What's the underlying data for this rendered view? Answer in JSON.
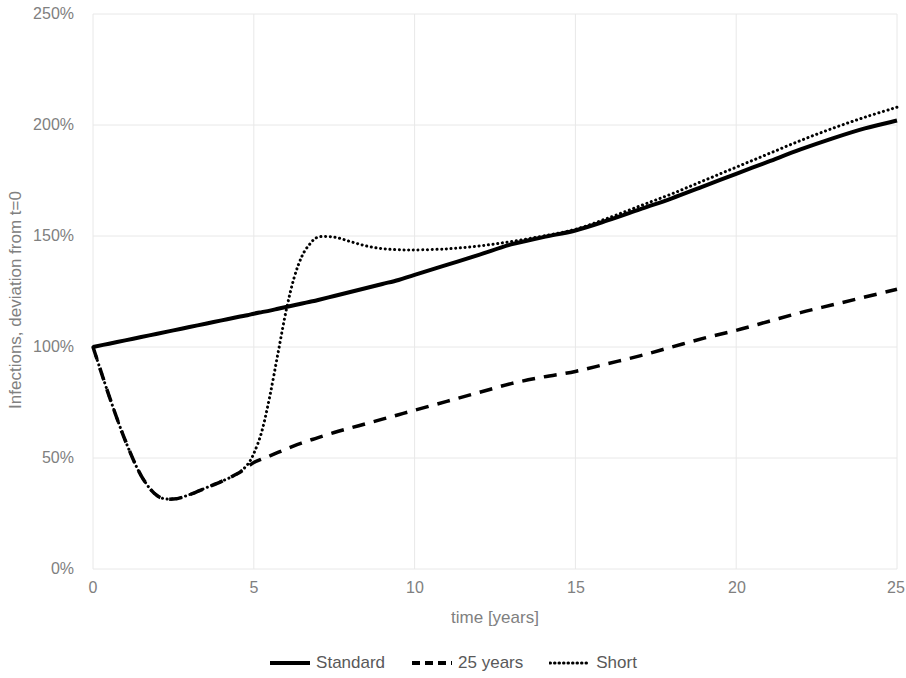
{
  "chart_data": {
    "type": "line",
    "title": "",
    "xlabel": "time [years]",
    "ylabel": "Infections, deviation from t=0",
    "xlim": [
      0,
      25
    ],
    "ylim": [
      0,
      250
    ],
    "xticks": [
      "0",
      "5",
      "10",
      "15",
      "20",
      "25"
    ],
    "yticks": [
      "0%",
      "50%",
      "100%",
      "150%",
      "200%",
      "250%"
    ],
    "grid": true,
    "legend_position": "bottom",
    "units": "percent",
    "x": [
      0,
      0.5,
      1,
      1.5,
      2,
      2.5,
      3,
      3.5,
      4,
      4.5,
      4.8,
      5,
      5.25,
      5.5,
      5.75,
      6,
      6.25,
      6.5,
      6.75,
      7,
      7.5,
      8,
      8.5,
      9,
      9.5,
      10,
      11,
      12,
      13,
      14,
      15,
      16,
      17,
      18,
      19,
      20,
      21,
      22,
      23,
      24,
      25
    ],
    "series": [
      {
        "name": "Standard",
        "style": "solid",
        "color": "#000000",
        "values": [
          100,
          101.5,
          103,
          104.5,
          106,
          107.5,
          109,
          110.5,
          112,
          113.5,
          114.3,
          115,
          115.7,
          116.4,
          117.2,
          118,
          118.8,
          119.6,
          120.4,
          121.2,
          123,
          124.8,
          126.6,
          128.4,
          130.2,
          132.5,
          137,
          141.5,
          146.2,
          149.5,
          152.5,
          157,
          162,
          167,
          172.5,
          178,
          183.5,
          189,
          194,
          198.5,
          202
        ]
      },
      {
        "name": "25 years",
        "style": "dashed",
        "color": "#000000",
        "values": [
          100,
          78,
          58,
          42,
          33,
          31.5,
          33.5,
          36.5,
          39.5,
          43,
          46,
          48,
          49.5,
          51,
          52.5,
          54,
          55.5,
          56.8,
          58,
          59.2,
          61.5,
          63.5,
          65.5,
          67.5,
          69.5,
          71.5,
          75.5,
          79.5,
          83.5,
          86.5,
          89,
          92.5,
          96,
          100,
          104,
          107.5,
          111.5,
          115.5,
          119,
          122.5,
          126
        ]
      },
      {
        "name": "Short",
        "style": "dotted",
        "color": "#000000",
        "values": [
          100,
          78,
          58,
          42,
          33,
          31.5,
          33.5,
          36.5,
          39.5,
          43,
          47,
          52,
          62,
          78,
          97,
          116,
          131,
          141,
          146.5,
          149.5,
          149.5,
          147.5,
          145.5,
          144.3,
          143.8,
          143.7,
          144.2,
          145.5,
          147.5,
          150,
          153,
          158,
          163.5,
          169,
          175,
          181,
          187,
          193,
          198.5,
          203.5,
          208
        ]
      }
    ]
  },
  "legend": {
    "items": [
      {
        "label": "Standard",
        "style": "solid"
      },
      {
        "label": "25 years",
        "style": "dashed"
      },
      {
        "label": "Short",
        "style": "dotted"
      }
    ]
  },
  "colors": {
    "series": "#000000",
    "axis_text": "#808080",
    "legend_text": "#595959",
    "gridline": "#e8e8e8",
    "background": "#ffffff"
  }
}
